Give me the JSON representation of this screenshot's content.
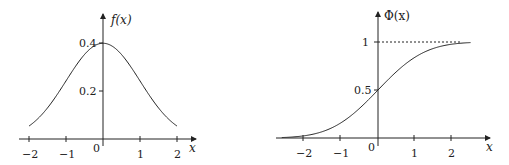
{
  "chart_data": [
    {
      "type": "line",
      "title": "",
      "ylabel": "f(x)",
      "xlabel": "x",
      "function": "standard normal probability density",
      "xlim": [
        -2,
        2
      ],
      "ylim": [
        0,
        0.4
      ],
      "grid": false,
      "x_ticks": [
        "−2",
        "−1",
        "0",
        "1",
        "2"
      ],
      "y_ticks": [
        "0.2",
        "0.4"
      ],
      "x": [
        -2,
        -1.5,
        -1,
        -0.5,
        0,
        0.5,
        1,
        1.5,
        2
      ],
      "values": [
        0.054,
        0.13,
        0.242,
        0.352,
        0.399,
        0.352,
        0.242,
        0.13,
        0.054
      ]
    },
    {
      "type": "line",
      "title": "",
      "ylabel": "Φ(x)",
      "xlabel": "x",
      "function": "standard normal cumulative distribution",
      "xlim": [
        -2.6,
        2.5
      ],
      "ylim": [
        0,
        1
      ],
      "grid": false,
      "x_ticks": [
        "−2",
        "−1",
        "0",
        "1",
        "2"
      ],
      "y_ticks": [
        "0.5",
        "1"
      ],
      "asymptote": {
        "y": 1,
        "style": "dashed"
      },
      "x": [
        -2.6,
        -2,
        -1.5,
        -1,
        -0.5,
        0,
        0.5,
        1,
        1.5,
        2,
        2.5
      ],
      "values": [
        0.005,
        0.023,
        0.067,
        0.159,
        0.309,
        0.5,
        0.691,
        0.841,
        0.933,
        0.977,
        0.994
      ]
    }
  ],
  "left": {
    "ylabel": "f(x)",
    "xlabel": "x",
    "x_ticks": [
      "−2",
      "−1",
      "0",
      "1",
      "2"
    ],
    "y_ticks": [
      "0.2",
      "0.4"
    ]
  },
  "right": {
    "ylabel": "Φ(x)",
    "xlabel": "x",
    "x_ticks": [
      "−2",
      "−1",
      "0",
      "1",
      "2"
    ],
    "y_ticks": [
      "0.5",
      "1"
    ]
  }
}
